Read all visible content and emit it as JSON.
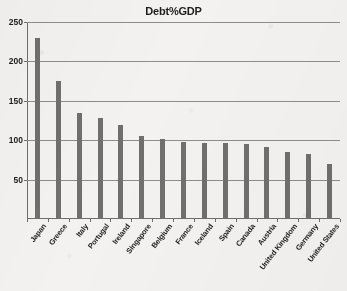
{
  "chart_data": {
    "type": "bar",
    "title": "Debt%GDP",
    "xlabel": "",
    "ylabel": "",
    "ylim": [
      0,
      250
    ],
    "yticks": [
      0,
      50,
      100,
      150,
      200,
      250
    ],
    "ytick_labels": [
      "",
      "50",
      "100",
      "150",
      "200",
      "250"
    ],
    "grid": true,
    "legend": false,
    "orientation": "vertical",
    "bar_color": "#6f6f6f",
    "categories": [
      "Japan",
      "Greece",
      "Italy",
      "Portugal",
      "Ireland",
      "Singapore",
      "Belgium",
      "France",
      "Iceland",
      "Spain",
      "Canada",
      "Austria",
      "United Kingdom",
      "Germany",
      "United States"
    ],
    "values": [
      230,
      175,
      135,
      128,
      119,
      105,
      102,
      98,
      97,
      96,
      95,
      92,
      85,
      82,
      70
    ]
  },
  "colors": {
    "background": "#f3f2f0",
    "bar": "#6f6f6f",
    "axis": "#6e6e6e",
    "gridline": "#8d8d8d",
    "text": "#1d1d1d"
  }
}
